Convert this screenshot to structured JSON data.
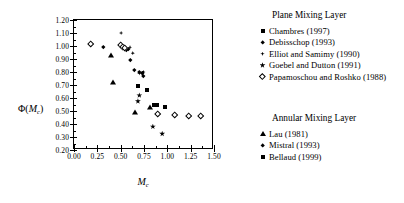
{
  "chart_data": {
    "type": "scatter",
    "title": "",
    "xlabel": "M_c",
    "ylabel": "Φ(M_c)",
    "xlim": [
      0.0,
      1.5
    ],
    "ylim": [
      0.2,
      1.2
    ],
    "xticks": [
      "0.00",
      "0.25",
      "0.50",
      "0.75",
      "1.00",
      "1.25",
      "1.50"
    ],
    "xtick_values": [
      0.0,
      0.25,
      0.5,
      0.75,
      1.0,
      1.25,
      1.5
    ],
    "yticks": [
      "0.20",
      "0.30",
      "0.40",
      "0.50",
      "0.60",
      "0.70",
      "0.80",
      "0.90",
      "1.00",
      "1.10",
      "1.20"
    ],
    "ytick_values": [
      0.2,
      0.3,
      0.4,
      0.5,
      0.6,
      0.7,
      0.8,
      0.9,
      1.0,
      1.1,
      1.2
    ],
    "grid": false,
    "legend_position": "right-outside",
    "series": [
      {
        "name": "Chambres (1997)",
        "group": "Plane Mixing Layer",
        "marker": "square-filled",
        "points": [
          [
            0.69,
            0.695
          ],
          [
            0.86,
            0.55
          ],
          [
            0.885,
            0.55
          ],
          [
            0.98,
            0.53
          ],
          [
            0.78,
            0.665
          ]
        ]
      },
      {
        "name": "Debisschop (1993)",
        "group": "Plane Mixing Layer",
        "marker": "diamond-filled",
        "points": [
          [
            0.33,
            0.975
          ],
          [
            0.62,
            0.88
          ],
          [
            0.66,
            0.8
          ],
          [
            0.72,
            0.785
          ],
          [
            0.755,
            0.775
          ],
          [
            0.76,
            0.755
          ],
          [
            0.575,
            0.955
          ],
          [
            0.6,
            0.965
          ]
        ]
      },
      {
        "name": "Elliot and Samimy (1990)",
        "group": "Plane Mixing Layer",
        "marker": "plus-diamond",
        "points": [
          [
            0.505,
            1.1
          ],
          [
            0.6,
            0.99
          ],
          [
            0.63,
            0.945
          ],
          [
            0.7,
            0.79
          ],
          [
            0.745,
            0.8
          ]
        ]
      },
      {
        "name": "Goebel and Dutton (1991)",
        "group": "Plane Mixing Layer",
        "marker": "star",
        "points": [
          [
            0.7,
            0.62
          ],
          [
            0.685,
            0.575
          ],
          [
            0.845,
            0.38
          ],
          [
            0.945,
            0.325
          ]
        ]
      },
      {
        "name": "Papamoschou and Roshko (1988)",
        "group": "Plane Mixing Layer",
        "marker": "diamond-open",
        "points": [
          [
            0.2,
            1.0
          ],
          [
            0.52,
            0.99
          ],
          [
            0.545,
            0.975
          ],
          [
            0.565,
            0.97
          ],
          [
            0.925,
            0.46
          ],
          [
            1.1,
            0.455
          ],
          [
            1.25,
            0.445
          ],
          [
            1.38,
            0.445
          ]
        ]
      },
      {
        "name": "Lau (1981)",
        "group": "Annular Mixing Layer",
        "marker": "triangle-filled",
        "points": [
          [
            0.425,
            0.905
          ],
          [
            0.445,
            0.7
          ],
          [
            0.69,
            0.47
          ],
          [
            0.845,
            0.505
          ]
        ]
      },
      {
        "name": "Mistral (1993)",
        "group": "Annular Mixing Layer",
        "marker": "diamond-filled",
        "points": [
          [
            0.755,
            0.775
          ]
        ]
      },
      {
        "name": "Bellaud (1999)",
        "group": "Annular Mixing Layer",
        "marker": "square-filled",
        "points": [
          [
            0.86,
            0.55
          ]
        ]
      }
    ]
  },
  "axes": {
    "y_title_prefix": "Φ(",
    "y_title_var": "M",
    "y_title_sub": "c",
    "y_title_suffix": ")",
    "x_title_var": "M",
    "x_title_sub": "c"
  },
  "legend": {
    "plane": {
      "title": "Plane Mixing Layer",
      "entries": [
        {
          "marker": "square-filled",
          "label": "Chambres (1997)"
        },
        {
          "marker": "diamond-filled",
          "label": "Debisschop (1993)"
        },
        {
          "marker": "plus-diamond",
          "label": "Elliot and Samimy (1990)"
        },
        {
          "marker": "star",
          "label": "Goebel and Dutton (1991)"
        },
        {
          "marker": "diamond-open",
          "label": "Papamoschou and Roshko (1988)"
        }
      ]
    },
    "annular": {
      "title": "Annular Mixing Layer",
      "entries": [
        {
          "marker": "triangle-filled",
          "label": "Lau (1981)"
        },
        {
          "marker": "diamond-filled",
          "label": "Mistral (1993)"
        },
        {
          "marker": "square-filled",
          "label": "Bellaud (1999)"
        }
      ]
    }
  },
  "colors": {
    "ink": "#000000",
    "background": "#ffffff"
  }
}
